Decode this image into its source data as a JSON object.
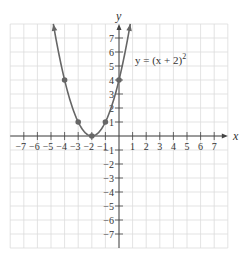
{
  "chart_data": {
    "type": "line",
    "title": "",
    "equation_label": "y = (x + 2)",
    "equation_exponent": "2",
    "xlabel": "x",
    "ylabel": "y",
    "xlim": [
      -8,
      8
    ],
    "ylim": [
      -8,
      8
    ],
    "grid": true,
    "x_ticks": [
      -7,
      -6,
      -5,
      -4,
      -3,
      -2,
      -1,
      1,
      2,
      3,
      4,
      5,
      6,
      7
    ],
    "y_ticks": [
      -7,
      -6,
      -5,
      -4,
      -3,
      -2,
      -1,
      1,
      2,
      3,
      4,
      5,
      6,
      7
    ],
    "series": [
      {
        "name": "y = (x + 2)^2",
        "function": "(x+2)^2",
        "domain": [
          -4.83,
          0.83
        ],
        "marked_points": [
          {
            "x": -4,
            "y": 4
          },
          {
            "x": -3,
            "y": 1
          },
          {
            "x": -2,
            "y": 0
          },
          {
            "x": -1,
            "y": 1
          },
          {
            "x": 0,
            "y": 4
          }
        ],
        "color": "#666666"
      }
    ]
  },
  "style": {
    "grid_color": "#dcdcdc",
    "axis_color": "#444444",
    "curve_color": "#666666"
  }
}
